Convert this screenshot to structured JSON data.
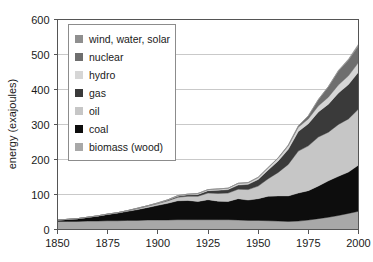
{
  "chart_data": {
    "type": "area",
    "title": "",
    "xlabel": "",
    "ylabel": "energy (exajoules)",
    "xlim": [
      1850,
      2000
    ],
    "ylim": [
      0,
      600
    ],
    "xticks": [
      1850,
      1875,
      1900,
      1925,
      1950,
      1975,
      2000
    ],
    "yticks": [
      0,
      100,
      200,
      300,
      400,
      500,
      600
    ],
    "grid": "horizontal",
    "stacked": true,
    "legend_position": "upper-left",
    "x": [
      1850,
      1855,
      1860,
      1865,
      1870,
      1875,
      1880,
      1885,
      1890,
      1895,
      1900,
      1905,
      1910,
      1915,
      1920,
      1925,
      1930,
      1935,
      1940,
      1945,
      1950,
      1955,
      1960,
      1965,
      1970,
      1975,
      1980,
      1985,
      1990,
      1995,
      2000
    ],
    "series": [
      {
        "name": "biomass (wood)",
        "color": "#a8a8a8",
        "values": [
          23,
          23,
          23,
          24,
          24,
          25,
          25,
          26,
          26,
          27,
          27,
          27,
          28,
          28,
          28,
          28,
          28,
          28,
          27,
          26,
          26,
          25,
          24,
          23,
          24,
          27,
          31,
          35,
          40,
          46,
          52
        ]
      },
      {
        "name": "coal",
        "color": "#0d0d0d",
        "values": [
          4,
          6,
          8,
          11,
          14,
          18,
          22,
          26,
          31,
          36,
          42,
          48,
          54,
          55,
          52,
          57,
          53,
          52,
          61,
          58,
          62,
          70,
          72,
          73,
          80,
          84,
          93,
          104,
          112,
          118,
          132
        ]
      },
      {
        "name": "oil",
        "color": "#c6c6c6",
        "values": [
          0,
          0,
          0,
          0,
          1,
          1,
          1,
          2,
          3,
          4,
          5,
          7,
          10,
          12,
          15,
          19,
          22,
          24,
          27,
          30,
          36,
          50,
          67,
          90,
          120,
          128,
          140,
          139,
          148,
          152,
          160
        ]
      },
      {
        "name": "gas",
        "color": "#3a3a3a",
        "values": [
          0,
          0,
          0,
          0,
          0,
          0,
          0,
          0,
          1,
          1,
          1,
          2,
          3,
          4,
          5,
          7,
          9,
          10,
          12,
          15,
          19,
          25,
          33,
          43,
          56,
          63,
          72,
          80,
          90,
          98,
          106
        ]
      },
      {
        "name": "hydro",
        "color": "#d6d6d6",
        "values": [
          0,
          0,
          0,
          0,
          0,
          0,
          0,
          0,
          0,
          0,
          1,
          1,
          2,
          2,
          3,
          3,
          4,
          4,
          5,
          5,
          6,
          7,
          8,
          10,
          12,
          14,
          17,
          20,
          23,
          25,
          27
        ]
      },
      {
        "name": "nuclear",
        "color": "#6e6e6e",
        "values": [
          0,
          0,
          0,
          0,
          0,
          0,
          0,
          0,
          0,
          0,
          0,
          0,
          0,
          0,
          0,
          0,
          0,
          0,
          0,
          0,
          0,
          0,
          1,
          2,
          4,
          9,
          18,
          30,
          40,
          45,
          48
        ]
      },
      {
        "name": "wind, water, solar",
        "color": "#8f8f8f",
        "values": [
          0,
          0,
          0,
          0,
          0,
          0,
          0,
          0,
          0,
          0,
          0,
          0,
          0,
          0,
          0,
          0,
          0,
          0,
          0,
          0,
          0,
          0,
          0,
          0,
          0,
          0,
          1,
          1,
          2,
          3,
          5
        ]
      }
    ],
    "totals_note": "",
    "total_2000": 530
  },
  "legend": {
    "items": [
      {
        "label": "wind, water, solar",
        "color": "#8f8f8f"
      },
      {
        "label": "nuclear",
        "color": "#6e6e6e"
      },
      {
        "label": "hydro",
        "color": "#d6d6d6"
      },
      {
        "label": "gas",
        "color": "#3a3a3a"
      },
      {
        "label": "oil",
        "color": "#c6c6c6"
      },
      {
        "label": "coal",
        "color": "#0d0d0d"
      },
      {
        "label": "biomass (wood)",
        "color": "#a8a8a8"
      }
    ]
  },
  "axes": {
    "y_title": "energy (exajoules)",
    "y_labels": [
      "600",
      "500",
      "400",
      "300",
      "200",
      "100",
      "0"
    ],
    "x_labels": [
      "1850",
      "1875",
      "1900",
      "1925",
      "1950",
      "1975",
      "2000"
    ]
  },
  "colors": {
    "axis": "#555555",
    "grid": "#c9c9c9",
    "text": "#1a1a1a",
    "legend_border": "#8c8c8c",
    "background": "#ffffff"
  }
}
